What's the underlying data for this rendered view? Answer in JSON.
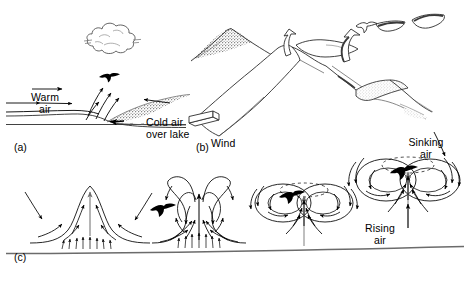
{
  "figure": {
    "width": 470,
    "height": 283,
    "background": "#ffffff",
    "ink": "#000000",
    "stipple": "#8d8d8d"
  },
  "panels": [
    {
      "id": "a",
      "id_label": "(a)",
      "name": "lake-breeze-front",
      "caption": "Warm air rising over a cold air wedge from a lake, forming a cumulus cloud",
      "labels": [
        {
          "name": "warm-air-label",
          "text": "Warm\nair",
          "x": 30,
          "y": 72
        },
        {
          "name": "cold-air-over-lake-label",
          "text": "Cold air\nover lake",
          "x": 152,
          "y": 96
        }
      ]
    },
    {
      "id": "b",
      "id_label": "(b)",
      "name": "ridge-lift",
      "caption": "Wind deflected upward along a mountain ridge producing slope lift for soaring birds",
      "labels": [
        {
          "name": "wind-label",
          "text": "Wind",
          "x": 200,
          "y": 127
        }
      ]
    },
    {
      "id": "c",
      "id_label": "(c)",
      "name": "thermal-development",
      "caption": "Four stages in the development of a thermal bubble rising from heated ground",
      "labels": [
        {
          "name": "sinking-air-label",
          "text": "Sinking\nair",
          "x": 404,
          "y": 116
        },
        {
          "name": "rising-air-label",
          "text": "Rising\nair",
          "x": 359,
          "y": 202
        }
      ],
      "stages": [
        {
          "name": "thermal-stage-1",
          "description": "Low dome of warm air over heated ground with inflow arrows"
        },
        {
          "name": "thermal-stage-2",
          "description": "Column rising, vortex rolls forming, bird entering lift"
        },
        {
          "name": "thermal-stage-3",
          "description": "Detached vortex ring torus with bird circling inside"
        },
        {
          "name": "thermal-stage-4",
          "description": "Mature thermal vortex ring with sinking air on the flanks"
        }
      ]
    }
  ],
  "ground_lines": [
    {
      "name": "panel-a-ground",
      "description": "Ground and lake surface lines in panel a"
    },
    {
      "name": "panel-c-ground",
      "description": "Heated ground surface line beneath the thermals in panel c"
    }
  ],
  "birds": [
    {
      "name": "bird-panel-a",
      "x": 109,
      "y": 76
    },
    {
      "name": "bird-panel-b-upper",
      "x": 366,
      "y": 25
    },
    {
      "name": "bird-panel-c-stage2",
      "x": 160,
      "y": 209
    },
    {
      "name": "bird-panel-c-stage3",
      "x": 289,
      "y": 197
    },
    {
      "name": "bird-panel-c-stage4",
      "x": 400,
      "y": 174
    }
  ],
  "cloud": {
    "name": "cumulus-cloud",
    "x": 110,
    "y": 36
  }
}
